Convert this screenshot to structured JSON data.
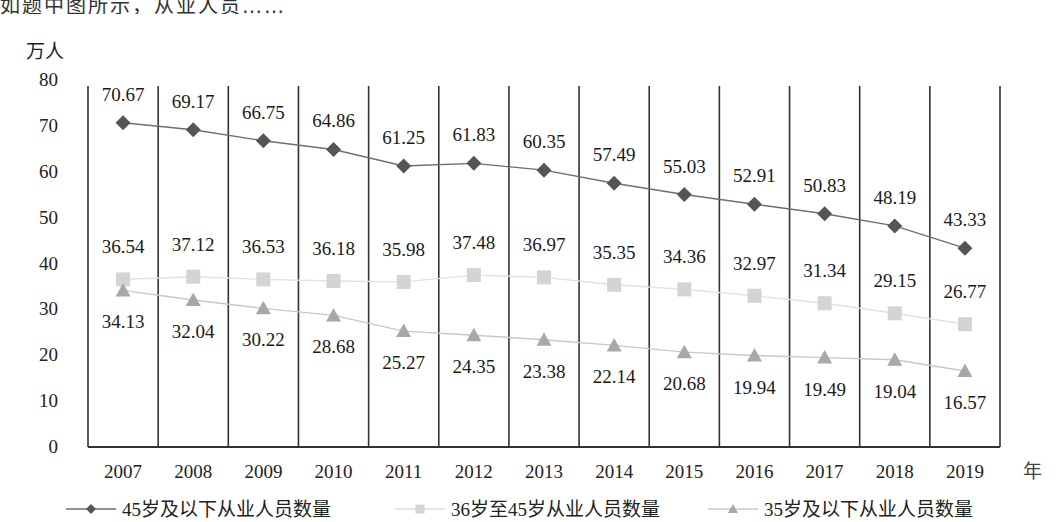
{
  "chart_data": {
    "type": "line",
    "title": "",
    "ylabel": "万人",
    "xlabel": "年",
    "ylim": [
      0,
      80
    ],
    "yticks": [
      0,
      10,
      20,
      30,
      40,
      50,
      60,
      70,
      80
    ],
    "grid": "vertical category separators",
    "legend_position": "bottom",
    "categories": [
      "2007",
      "2008",
      "2009",
      "2010",
      "2011",
      "2012",
      "2013",
      "2014",
      "2015",
      "2016",
      "2017",
      "2018",
      "2019"
    ],
    "series": [
      {
        "name": "45岁及以下从业人员数量",
        "marker": "diamond",
        "color": "#555555",
        "values": [
          70.67,
          69.17,
          66.75,
          64.86,
          61.25,
          61.83,
          60.35,
          57.49,
          55.03,
          52.91,
          50.83,
          48.19,
          43.33
        ]
      },
      {
        "name": "36岁至45岁从业人员数量",
        "marker": "square",
        "color": "#d4d4d4",
        "values": [
          36.54,
          37.12,
          36.53,
          36.18,
          35.98,
          37.48,
          36.97,
          35.35,
          34.36,
          32.97,
          31.34,
          29.15,
          26.77
        ]
      },
      {
        "name": "35岁及以下从业人员数量",
        "marker": "triangle",
        "color": "#a8a8a8",
        "values": [
          34.13,
          32.04,
          30.22,
          28.68,
          25.27,
          24.35,
          23.38,
          22.14,
          20.68,
          19.94,
          19.49,
          19.04,
          16.57
        ]
      }
    ]
  },
  "header": {
    "cropped_text": "如题中图所示，从业人员……"
  }
}
